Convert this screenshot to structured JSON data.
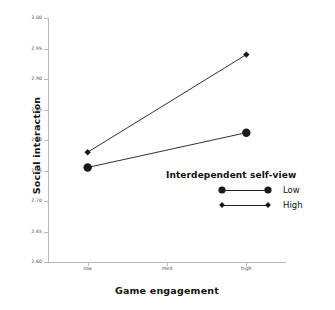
{
  "chart_data": {
    "type": "line",
    "title": "",
    "xlabel": "Game engagement",
    "ylabel": "Social interaction",
    "categories": [
      "low",
      "med",
      "high"
    ],
    "ylim": [
      2.6,
      3.0
    ],
    "yticks": [
      "3.00",
      "2.95",
      "2.90",
      "2.85",
      "2.80",
      "2.75",
      "2.70",
      "2.65",
      "2.60"
    ],
    "ytick_values": [
      3.0,
      2.95,
      2.9,
      2.85,
      2.8,
      2.75,
      2.7,
      2.65,
      2.6
    ],
    "grid": false,
    "legend_position": "inside-lower-right",
    "legend_title": "Interdependent self-view",
    "series": [
      {
        "name": "Low",
        "marker": "circle",
        "x": [
          "low",
          "high"
        ],
        "values": [
          2.755,
          2.812
        ]
      },
      {
        "name": "High",
        "marker": "diamond",
        "x": [
          "low",
          "high"
        ],
        "values": [
          2.78,
          2.94
        ]
      }
    ]
  },
  "axes": {
    "y_title": "Social interaction",
    "x_title": "Game engagement"
  },
  "legend": {
    "title": "Interdependent self-view",
    "entries": [
      {
        "label": "Low",
        "marker": "circle"
      },
      {
        "label": "High",
        "marker": "diamond"
      }
    ]
  },
  "colors": {
    "data": "#1a1a1a",
    "axis": "#b9b9b9",
    "tick_text": "#4a4a4a",
    "background": "#ffffff"
  }
}
